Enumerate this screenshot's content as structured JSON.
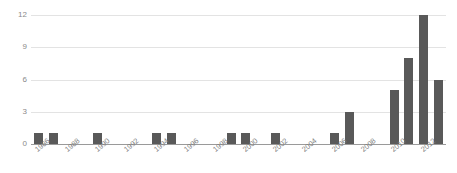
{
  "chart_data": {
    "type": "bar",
    "title": "",
    "xlabel": "",
    "ylabel": "",
    "ylim": [
      0,
      12
    ],
    "grid": true,
    "legend": "none",
    "bar_color": "#595959",
    "gridline_color": "#e3e3e3",
    "axis_color": "#9a9a9a",
    "tick_label_color": "#8a8a8a",
    "y_ticks": [
      "12",
      "9",
      "6",
      "3",
      "0"
    ],
    "y_tick_values": [
      12,
      9,
      6,
      3,
      0
    ],
    "x_tick_labels": [
      "1986",
      "1988",
      "1990",
      "1992",
      "1994",
      "1996",
      "1998",
      "2000",
      "2002",
      "2004",
      "2006",
      "2008",
      "2010",
      "2012"
    ],
    "x_tick_years": [
      1986,
      1988,
      1990,
      1992,
      1994,
      1996,
      1998,
      2000,
      2002,
      2004,
      2006,
      2008,
      2010,
      2012
    ],
    "categories": [
      1986,
      1987,
      1988,
      1989,
      1990,
      1991,
      1992,
      1993,
      1994,
      1995,
      1996,
      1997,
      1998,
      1999,
      2000,
      2001,
      2002,
      2003,
      2004,
      2005,
      2006,
      2007,
      2008,
      2009,
      2010,
      2011,
      2012,
      2013
    ],
    "values": [
      1,
      1,
      0,
      0,
      1,
      0,
      0,
      0,
      1,
      1,
      0,
      0,
      0,
      1,
      1,
      0,
      1,
      0,
      0,
      0,
      1,
      3,
      0,
      0,
      5,
      8,
      12,
      6
    ]
  }
}
